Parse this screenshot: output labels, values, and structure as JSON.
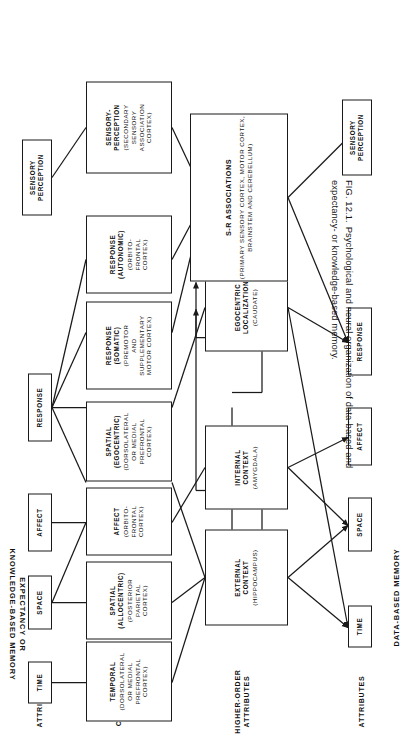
{
  "figure": {
    "caption_number": "FIG. 12.1.",
    "caption_text": "Psychological and neural organization of data-based and expectancy- or knowledge-based memory."
  },
  "bands": {
    "top": "EXPECTANCY OR\nKNOWLEDGE-BASED MEMORY",
    "bottom": "DATA-BASED MEMORY"
  },
  "rows": {
    "top_attributes": "ATTRIBUTES",
    "cognitive_maps": "COGNITIVE\nMAPS",
    "higher_order": "HIGHER-ORDER\nATTRIBUTES",
    "bottom_attributes": "ATTRIBUTES"
  },
  "top_attributes": [
    {
      "id": "time",
      "label": "TIME"
    },
    {
      "id": "space",
      "label": "SPACE"
    },
    {
      "id": "affect",
      "label": "AFFECT"
    },
    {
      "id": "response",
      "label": "RESPONSE"
    },
    {
      "id": "sensory",
      "label": "SENSORY\nPERCEPTION"
    }
  ],
  "cognitive_map_nodes": [
    {
      "id": "temporal",
      "title": "TEMPORAL",
      "detail": "(DORSOLATERAL\nOR MEDIAL\nPREFRONTAL\nCORTEX)"
    },
    {
      "id": "spatial-allocentric",
      "title": "SPATIAL\n(ALLOCENTRIC)",
      "detail": "(POSTERIOR\nPARIETAL\nCORTEX)"
    },
    {
      "id": "affect-node",
      "title": "AFFECT",
      "detail": "(ORBITO-\nFRONTAL\nCORTEX)"
    },
    {
      "id": "spatial-egocentric",
      "title": "SPATIAL\n(EGOCENTRIC)",
      "detail": "(DORSOLATERAL\nOR MEDIAL\nPREFRONTAL\nCORTEX)"
    },
    {
      "id": "response-somatic",
      "title": "RESPONSE\n(SOMATIC)",
      "detail": "(PREMOTOR\nAND\nSUPPLEMENTARY\nMOTOR CORTEX)"
    },
    {
      "id": "response-autonomic",
      "title": "RESPONSE\n(AUTONOMIC)",
      "detail": "(ORBITO-\nFRONTAL\nCORTEX)"
    },
    {
      "id": "sensory-perception-node",
      "title": "SENSORY-\nPERCEPTION",
      "detail": "(SECONDARY\nSENSORY\nASSOCIATION\nCORTEX)"
    }
  ],
  "higher_order_nodes": [
    {
      "id": "external-context",
      "title": "EXTERNAL\nCONTEXT",
      "detail": "(HIPPOCAMPUS)"
    },
    {
      "id": "internal-context",
      "title": "INTERNAL\nCONTEXT",
      "detail": "(AMYGDALA)"
    },
    {
      "id": "egocentric-localization",
      "title": "EGOCENTRIC\nLOCALIZATION",
      "detail": "(CAUDATE)"
    },
    {
      "id": "sr-associations",
      "title": "S-R  ASSOCIATIONS",
      "detail": "(PRIMARY SENSORY CORTEX, MOTOR CORTEX,\nBRAINSTEM AND CEREBELLUM)"
    }
  ],
  "bottom_attributes": [
    {
      "id": "time-b",
      "label": "TIME"
    },
    {
      "id": "space-b",
      "label": "SPACE"
    },
    {
      "id": "affect-b",
      "label": "AFFECT"
    },
    {
      "id": "response-b",
      "label": "RESPONSE"
    },
    {
      "id": "sensory-b",
      "label": "SENSORY\nPERCEPTION"
    }
  ],
  "colors": {
    "ink": "#1a1a1a",
    "paper": "#ffffff"
  }
}
